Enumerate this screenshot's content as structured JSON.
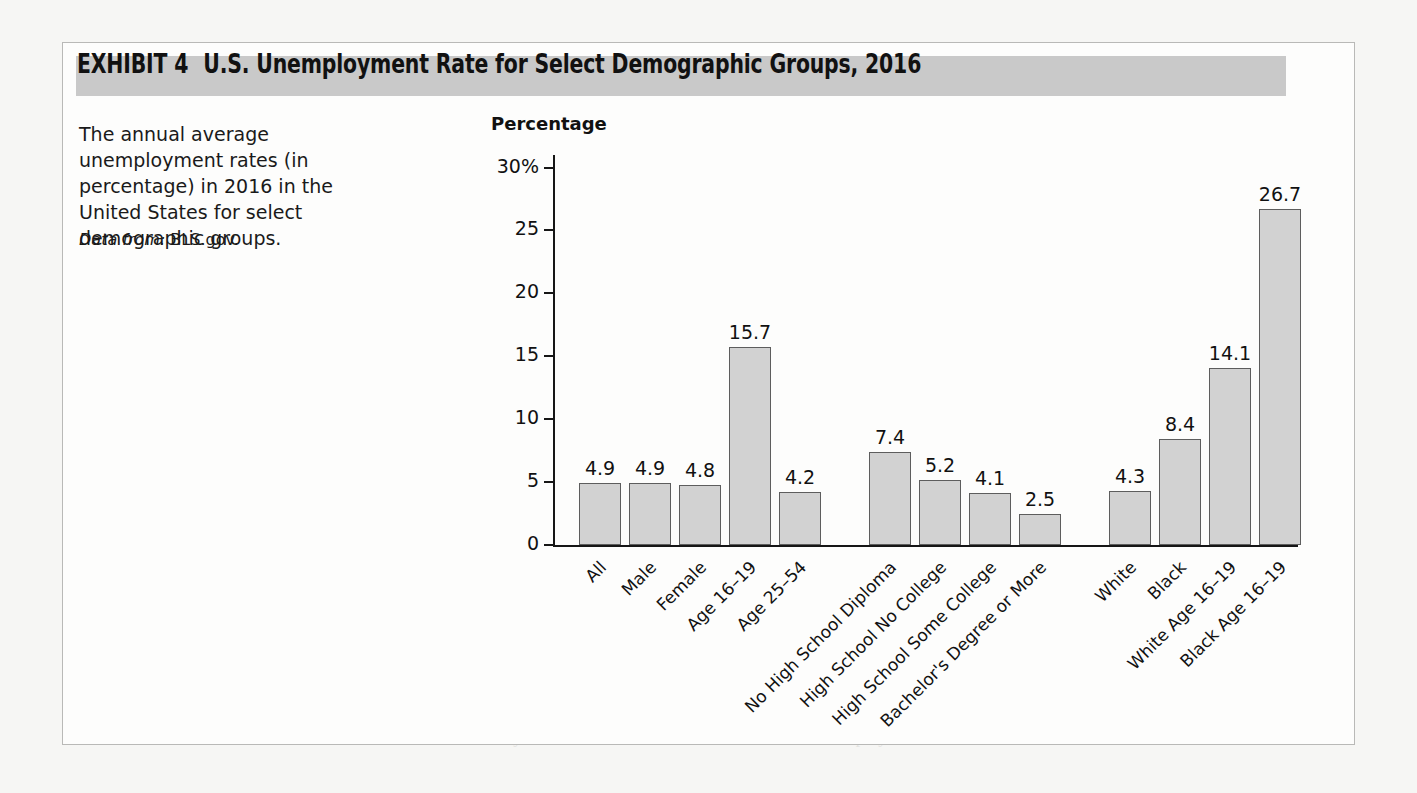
{
  "exhibit": {
    "label": "EXHIBIT 4",
    "title": "U.S. Unemployment Rate for Select Demographic Groups, 2016",
    "caption": "The annual average unemployment rates (in percentage) in 2016 in the United States for select demographic groups.",
    "source_prefix": "Data from:",
    "source_value": "BLS.gov.",
    "accent_banner_color": "#c9c9c9",
    "bar_fill_color": "#d2d2d2",
    "bar_border_color": "#5d5d5d"
  },
  "chart_data": {
    "type": "bar",
    "title": "U.S. Unemployment Rate for Select Demographic Groups, 2016",
    "xlabel": "",
    "ylabel": "Percentage",
    "ylim": [
      0,
      31
    ],
    "grid": false,
    "legend": "none",
    "ytick_labels": [
      "30%",
      "25",
      "20",
      "15",
      "10",
      "5",
      "0"
    ],
    "ytick_values": [
      30,
      25,
      20,
      15,
      10,
      5,
      0
    ],
    "categories": [
      "All",
      "Male",
      "Female",
      "Age 16–19",
      "Age 25–54",
      "No High School Diploma",
      "High School No College",
      "High School Some College",
      "Bachelor's Degree or More",
      "White",
      "Black",
      "White Age 16–19",
      "Black Age 16–19"
    ],
    "values": [
      4.9,
      4.9,
      4.8,
      15.7,
      4.2,
      7.4,
      5.2,
      4.1,
      2.5,
      4.3,
      8.4,
      14.1,
      26.7
    ],
    "value_labels": [
      "4.9",
      "4.9",
      "4.8",
      "15.7",
      "4.2",
      "7.4",
      "5.2",
      "4.1",
      "2.5",
      "4.3",
      "8.4",
      "14.1",
      "26.7"
    ],
    "groups": [
      {
        "name": "Overall and sex and age",
        "category_indexes": [
          0,
          1,
          2,
          3,
          4
        ]
      },
      {
        "name": "Education",
        "category_indexes": [
          5,
          6,
          7,
          8
        ]
      },
      {
        "name": "Race and age",
        "category_indexes": [
          9,
          10,
          11,
          12
        ]
      }
    ]
  },
  "background_text": {
    "lines": [
      "Like GDP, the U.S. unemployment rate is a useful, but not perfect, measure of",
      "economic performance. You will recall that the unemployment rate measures only",
      "adult individuals employed full time or part time or unemployed and actively seeking a",
      "job. Full-time students and homemakers are not part of the adult labor force, although",
      "the adult population includes many of these individuals whose contributions are not",
      "included.",
      "Marginally Attached Workers and Discouraged Workers  Not everyone who wants",
      "to work is currently employed or is considered unemployed. Marginally attached",
      "workers are individuals who have been unemployed in the past 12 months and have",
      "searched for work, but currently are not actively looking for employment. Because",
      "they are not actively searching for work, they are not considered part of the",
      "labor force and are not counted in the unemployment rate.",
      "Among marginally attached workers are some individuals who are discouraged",
      "workers. Discouraged workers are marginally attached individuals who are able to work,",
      "but who are not actively searching for a job because they believe they will not be able to",
      "find one. They are available to work, and given the opportunity, they would accept a job.",
      "They will not, however, search for a job, as they reject the likelihood of finding one at",
      "their current skill and experience level."
    ]
  }
}
